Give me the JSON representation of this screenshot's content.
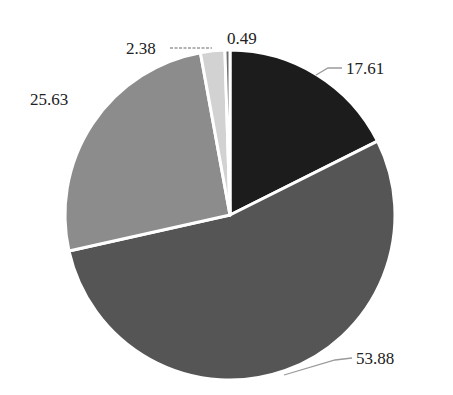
{
  "chart_data": {
    "type": "pie",
    "title": "",
    "start_angle": "12 o'clock",
    "direction": "clockwise",
    "legend": "none",
    "slices": [
      {
        "label": "17.61",
        "value": 17.61,
        "color": "#1c1c1c"
      },
      {
        "label": "53.88",
        "value": 53.88,
        "color": "#555555"
      },
      {
        "label": "25.63",
        "value": 25.63,
        "color": "#8c8c8c"
      },
      {
        "label": "2.38",
        "value": 2.38,
        "color": "#d2d2d2"
      },
      {
        "label": "0.49",
        "value": 0.49,
        "color": "#6e6e6e"
      }
    ],
    "categories": [
      "17.61",
      "53.88",
      "25.63",
      "2.38",
      "0.49"
    ],
    "values": [
      17.61,
      53.88,
      25.63,
      2.38,
      0.49
    ],
    "slice_separator_color": "#ffffff"
  }
}
